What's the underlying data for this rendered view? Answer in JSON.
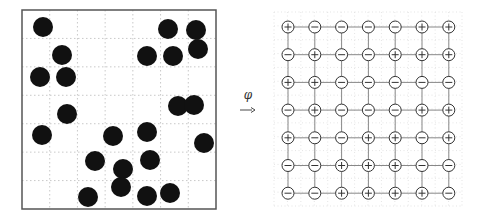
{
  "diagram": {
    "type": "particle-to-lattice mapping",
    "mapping_label": "φ",
    "colors": {
      "particle": "#111111",
      "frame": "#555555",
      "grid": "#bbbbbb",
      "lattice_edge": "#888888",
      "node_stroke": "#333333"
    },
    "left_panel": {
      "frame": {
        "x": 22,
        "y": 10,
        "width": 194,
        "height": 199
      },
      "grid_divisions": 7,
      "particle_radius": 10,
      "particles": [
        {
          "x": 43,
          "y": 27
        },
        {
          "x": 168,
          "y": 29
        },
        {
          "x": 196,
          "y": 30
        },
        {
          "x": 62,
          "y": 55
        },
        {
          "x": 147,
          "y": 56
        },
        {
          "x": 173,
          "y": 56
        },
        {
          "x": 198,
          "y": 49
        },
        {
          "x": 40,
          "y": 77
        },
        {
          "x": 66,
          "y": 77
        },
        {
          "x": 67,
          "y": 114
        },
        {
          "x": 178,
          "y": 106
        },
        {
          "x": 194,
          "y": 105
        },
        {
          "x": 42,
          "y": 135
        },
        {
          "x": 113,
          "y": 136
        },
        {
          "x": 147,
          "y": 132
        },
        {
          "x": 204,
          "y": 143
        },
        {
          "x": 95,
          "y": 161
        },
        {
          "x": 150,
          "y": 160
        },
        {
          "x": 123,
          "y": 169
        },
        {
          "x": 121,
          "y": 187
        },
        {
          "x": 88,
          "y": 197
        },
        {
          "x": 147,
          "y": 196
        },
        {
          "x": 170,
          "y": 193
        }
      ]
    },
    "arrow": {
      "x1": 240,
      "x2": 255,
      "y": 110
    },
    "right_panel": {
      "dotted_frame": {
        "x": 274,
        "y": 12,
        "width": 188,
        "height": 194
      },
      "origin": {
        "x": 288,
        "y": 27
      },
      "pitch_x": 26.8,
      "pitch_y": 27.7,
      "node_radius": 6,
      "spins": [
        [
          "+",
          "-",
          "-",
          "-",
          "-",
          "+",
          "+"
        ],
        [
          "-",
          "+",
          "-",
          "-",
          "+",
          "+",
          "+"
        ],
        [
          "+",
          "+",
          "-",
          "-",
          "-",
          "-",
          "-"
        ],
        [
          "-",
          "+",
          "-",
          "-",
          "-",
          "+",
          "+"
        ],
        [
          "+",
          "-",
          "-",
          "+",
          "+",
          "-",
          "+"
        ],
        [
          "-",
          "-",
          "+",
          "+",
          "+",
          "-",
          "-"
        ],
        [
          "-",
          "-",
          "+",
          "+",
          "+",
          "+",
          "-"
        ]
      ]
    }
  }
}
